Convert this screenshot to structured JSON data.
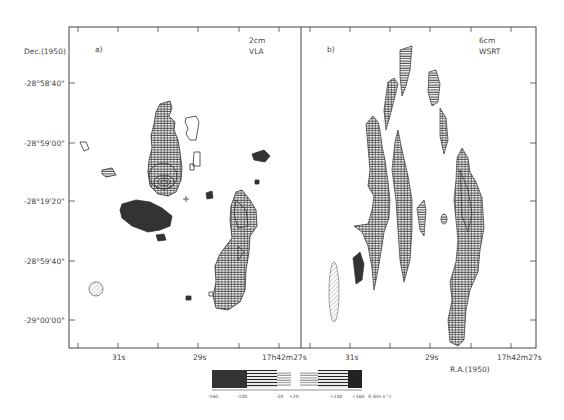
{
  "figure": {
    "y_axis_title": "Dec.(1950)",
    "x_axis_title": "R.A.(1950)",
    "y_ticks": [
      {
        "label": "-28°58'40\"",
        "y": 83
      },
      {
        "label": "-28°59'00\"",
        "y": 143
      },
      {
        "label": "-28°19'20\"",
        "y": 201
      },
      {
        "label": "-28°59'40\"",
        "y": 261
      },
      {
        "label": "-29°00'00\"",
        "y": 320
      }
    ],
    "panels": [
      {
        "id": "a",
        "label": "a)",
        "band": "2cm",
        "instrument": "VLA",
        "x_ticks": [
          {
            "label": "31s",
            "x": 117
          },
          {
            "label": "29s",
            "x": 178
          },
          {
            "label": "17h42m27s",
            "x": 282
          }
        ]
      },
      {
        "id": "b",
        "label": "b)",
        "band": "6cm",
        "instrument": "WSRT",
        "x_ticks": [
          {
            "label": "31s",
            "x": 350
          },
          {
            "label": "29s",
            "x": 430
          },
          {
            "label": "17h42m27s",
            "x": 511
          }
        ]
      }
    ],
    "velocity_scale": {
      "tick_labels": [
        "-160",
        "-100",
        "-20",
        "+20",
        "+100",
        "+160"
      ],
      "unit": "V (km s⁻¹)"
    }
  }
}
